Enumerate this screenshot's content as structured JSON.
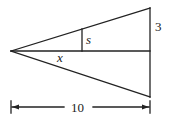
{
  "diagram": {
    "type": "geometry",
    "labels": {
      "s": "s",
      "three": "3",
      "x": "x",
      "ten": "10"
    },
    "colors": {
      "stroke": "#222222",
      "background": "#ffffff"
    },
    "points": {
      "apex": [
        11,
        51
      ],
      "top_right": [
        150,
        8
      ],
      "bottom_right": [
        150,
        97
      ],
      "mid_right": [
        150,
        51
      ],
      "s_top": [
        82,
        29
      ],
      "s_bottom": [
        82,
        51
      ]
    },
    "dimension": {
      "label": "10",
      "from_x": 11,
      "to_x": 150,
      "y": 107
    }
  }
}
